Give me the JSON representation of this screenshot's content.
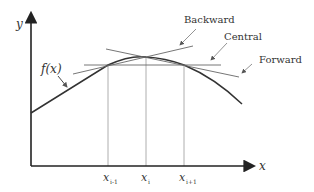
{
  "diagram": {
    "axes": {
      "y_label": "y",
      "x_label": "x"
    },
    "function_label": "f(x)",
    "tick_labels": [
      {
        "base": "x",
        "sub": "i-1"
      },
      {
        "base": "x",
        "sub": "i"
      },
      {
        "base": "x",
        "sub": "i+1"
      }
    ],
    "annotations": {
      "backward": "Backward",
      "central": "Central",
      "forward": "Forward"
    },
    "colors": {
      "axis": "#222222",
      "curve": "#333333",
      "tangent": "#555555",
      "grid": "#999999",
      "text": "#333333"
    }
  }
}
